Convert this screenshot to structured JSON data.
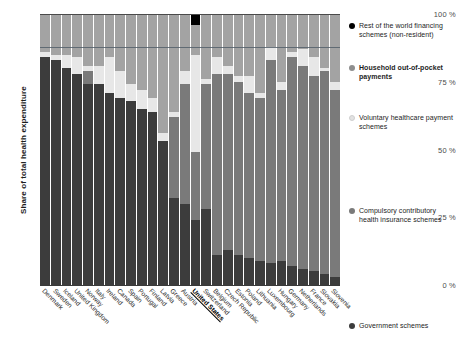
{
  "axes": {
    "ylabel": "Share of total health expenditure",
    "yticks": [
      "100 %",
      "75 %",
      "50 %",
      "25 %",
      "0 %"
    ],
    "ytick_values": [
      100,
      75,
      50,
      25,
      0
    ]
  },
  "legend": [
    {
      "key": "rest_of_world",
      "label": "Rest of the world financing schemes (non-resident)",
      "color": "#000000",
      "bold": false
    },
    {
      "key": "household_oop",
      "label": "Household out-of-pocket payments",
      "color": "#8e8e8e",
      "bold": true
    },
    {
      "key": "voluntary",
      "label": "Voluntary healthcare payment schemes",
      "color": "#e2e2e2",
      "bold": false
    },
    {
      "key": "compulsory",
      "label": "Compulsory contributory health insurance schemes",
      "color": "#7a7a7a",
      "bold": false
    },
    {
      "key": "government",
      "label": "Government schemes",
      "color": "#3c3c3c",
      "bold": false
    }
  ],
  "colors": {
    "government": "#3c3c3c",
    "compulsory": "#7a7a7a",
    "voluntary": "#e7e7e7",
    "household_oop": "#a3a3a3",
    "rest_of_world": "#000000",
    "axis": "#4a4a4a",
    "text": "#1d1d1d"
  },
  "chart_data": {
    "type": "bar",
    "title": "",
    "xlabel": "",
    "ylabel": "Share of total health expenditure",
    "ylim": [
      0,
      100
    ],
    "stacked": true,
    "grid": false,
    "legend_position": "right",
    "categories": [
      "Denmark",
      "Sweden",
      "Iceland",
      "United Kingdom",
      "Norway",
      "Italy",
      "Ireland",
      "Canada",
      "Spain",
      "Portugal",
      "Finland",
      "Latvia",
      "Greece",
      "Austria",
      "United States",
      "Switzerland",
      "Belgium",
      "Czech Republic",
      "Estonia",
      "Poland",
      "Lithuania",
      "Luxembourg",
      "Hungary",
      "Germany",
      "Netherlands",
      "France",
      "Slovakia",
      "Slovenia"
    ],
    "highlight_category": "United States",
    "series": [
      {
        "name": "Government schemes",
        "values": [
          84,
          83,
          80,
          78,
          74,
          74,
          71,
          69,
          68,
          65,
          64,
          53,
          32,
          30,
          24,
          28,
          11,
          13,
          11,
          10,
          9,
          8,
          9,
          7,
          6,
          5,
          4,
          3
        ]
      },
      {
        "name": "Compulsory contributory health insurance schemes",
        "values": [
          0,
          0,
          0,
          0,
          5,
          0,
          0,
          0,
          0,
          0,
          0,
          0,
          30,
          44,
          25,
          46,
          67,
          65,
          64,
          61,
          60,
          75,
          63,
          77,
          75,
          72,
          75,
          69
        ]
      },
      {
        "name": "Voluntary healthcare payment schemes",
        "values": [
          2,
          2,
          5,
          6,
          2,
          7,
          13,
          10,
          6,
          7,
          5,
          3,
          2,
          5,
          36,
          2,
          6,
          3,
          2,
          6,
          2,
          5,
          3,
          2,
          6,
          7,
          1,
          3
        ]
      },
      {
        "name": "Household out-of-pocket payments",
        "values": [
          14,
          15,
          15,
          16,
          19,
          19,
          16,
          21,
          26,
          28,
          31,
          44,
          36,
          21,
          11,
          24,
          16,
          19,
          23,
          23,
          29,
          12,
          25,
          14,
          13,
          16,
          20,
          25
        ]
      },
      {
        "name": "Rest of the world financing schemes (non-resident)",
        "values": [
          0,
          0,
          0,
          0,
          0,
          0,
          0,
          0,
          0,
          0,
          0,
          0,
          0,
          0,
          4,
          0,
          0,
          0,
          0,
          0,
          0,
          0,
          0,
          0,
          0,
          0,
          0,
          0
        ]
      }
    ]
  }
}
